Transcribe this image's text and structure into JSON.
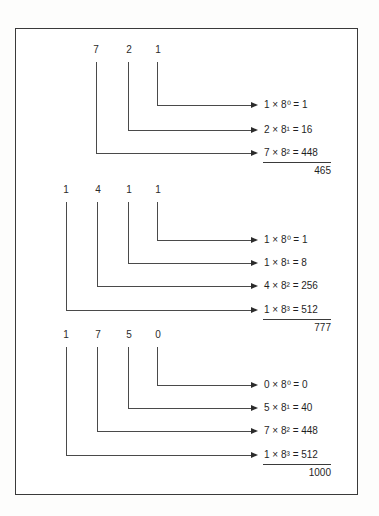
{
  "figure": {
    "frame_color": "#3a3a3a",
    "line_color": "#4a4a4a",
    "text_color": "#1f1f1f",
    "groups": [
      {
        "name": "octal-721",
        "octal_digits": [
          "7",
          "2",
          "1"
        ],
        "rows": [
          {
            "coefficient": "1",
            "base": "8",
            "exponent": "0",
            "product": "1",
            "text": "1 × 8⁰ = 1"
          },
          {
            "coefficient": "2",
            "base": "8",
            "exponent": "1",
            "product": "16",
            "text": "2 × 8¹ = 16"
          },
          {
            "coefficient": "7",
            "base": "8",
            "exponent": "2",
            "product": "448",
            "text": "7 × 8² = 448"
          }
        ],
        "total": "465"
      },
      {
        "name": "octal-1411",
        "octal_digits": [
          "1",
          "4",
          "1",
          "1"
        ],
        "rows": [
          {
            "coefficient": "1",
            "base": "8",
            "exponent": "0",
            "product": "1",
            "text": "1 × 8⁰ = 1"
          },
          {
            "coefficient": "1",
            "base": "8",
            "exponent": "1",
            "product": "8",
            "text": "1 × 8¹ = 8"
          },
          {
            "coefficient": "4",
            "base": "8",
            "exponent": "2",
            "product": "256",
            "text": "4 × 8² = 256"
          },
          {
            "coefficient": "1",
            "base": "8",
            "exponent": "3",
            "product": "512",
            "text": "1 × 8³ = 512"
          }
        ],
        "total": "777"
      },
      {
        "name": "octal-1750",
        "octal_digits": [
          "1",
          "7",
          "5",
          "0"
        ],
        "rows": [
          {
            "coefficient": "0",
            "base": "8",
            "exponent": "0",
            "product": "0",
            "text": "0 × 8⁰ = 0"
          },
          {
            "coefficient": "5",
            "base": "8",
            "exponent": "1",
            "product": "40",
            "text": "5 × 8¹ = 40"
          },
          {
            "coefficient": "7",
            "base": "8",
            "exponent": "2",
            "product": "448",
            "text": "7 × 8² = 448"
          },
          {
            "coefficient": "1",
            "base": "8",
            "exponent": "3",
            "product": "512",
            "text": "1 × 8³ = 512"
          }
        ],
        "total": "1000"
      }
    ]
  }
}
